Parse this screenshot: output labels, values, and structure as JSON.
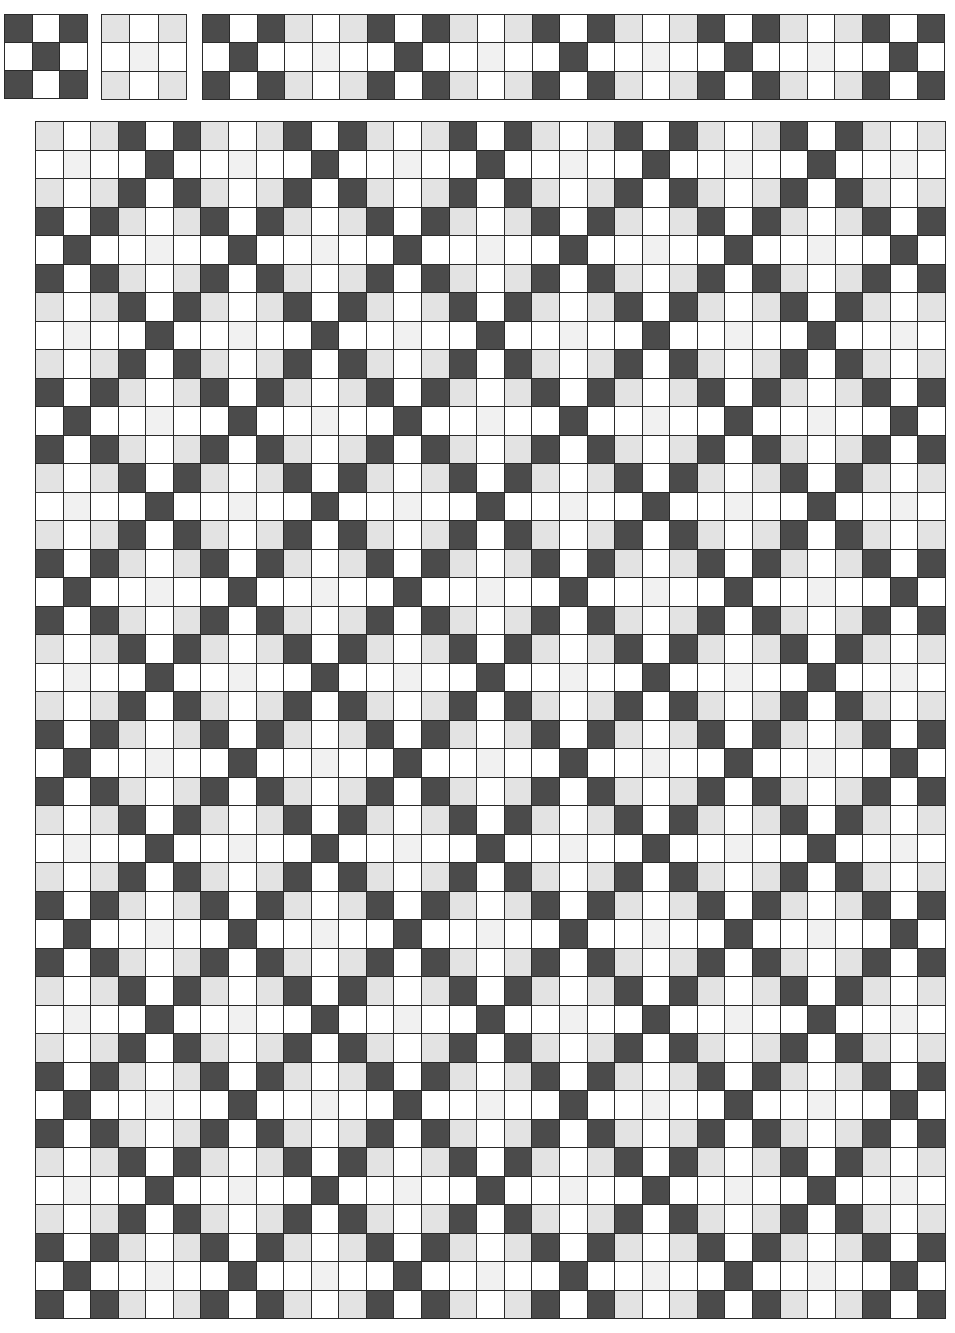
{
  "legend": {
    "D": "dark (interlaced)",
    "L": "light gray",
    "V": "very light gray",
    "W": "white"
  },
  "colors": {
    "D": "#4b4b4b",
    "L": "#e3e3e3",
    "V": "#f1f1f1",
    "W": "#ffffff",
    "grid_line": "#2a2a2a"
  },
  "threading_block": {
    "cols": 3,
    "rows": 3,
    "cells": [
      "DWD",
      "WDW",
      "DWD"
    ]
  },
  "tieup_block": {
    "cols": 3,
    "rows": 3,
    "cells": [
      "LWL",
      "WVW",
      "LWL"
    ]
  },
  "treadling_strip": {
    "cols": 27,
    "rows": 3,
    "cells": [
      "DWDLWLDWDLWLDWDLWLDWDLWLDWD",
      "WDWWVWWDWWVWWDWWVWWDWWVWWDW",
      "DWDLWLDWDLWLDWDLWLDWDLWLDWD"
    ]
  },
  "drawdown": {
    "cols": 33,
    "rows": 42,
    "repeat": "6x6",
    "cells": [
      "LWLDWDLWLDWDLWLDWDLWLDWDLWLDWDLWL",
      "WVWWDWWVWWDWWVWWDWWVWWDWWVWWDWWVW",
      "LWLDWDLWLDWDLWLDWDLWLDWDLWLDWDLWL",
      "DWDLWLDWDLWLDWDLWLDWDLWLDWDLWLDWD",
      "WDWWVWWDWWVWWDWWVWWDWWVWWDWWVWWDW",
      "DWDLWLDWDLWLDWDLWLDWDLWLDWDLWLDWD",
      "LWLDWDLWLDWDLWLDWDLWLDWDLWLDWDLWL",
      "WVWWDWWVWWDWWVWWDWWVWWDWWVWWDWWVW",
      "LWLDWDLWLDWDLWLDWDLWLDWDLWLDWDLWL",
      "DWDLWLDWDLWLDWDLWLDWDLWLDWDLWLDWD",
      "WDWWVWWDWWVWWDWWVWWDWWVWWDWWVWWDW",
      "DWDLWLDWDLWLDWDLWLDWDLWLDWDLWLDWD",
      "LWLDWDLWLDWDLWLDWDLWLDWDLWLDWDLWL",
      "WVWWDWWVWWDWWVWWDWWVWWDWWVWWDWWVW",
      "LWLDWDLWLDWDLWLDWDLWLDWDLWLDWDLWL",
      "DWDLWLDWDLWLDWDLWLDWDLWLDWDLWLDWD",
      "WDWWVWWDWWVWWDWWVWWDWWVWWDWWVWWDW",
      "DWDLWLDWDLWLDWDLWLDWDLWLDWDLWLDWD",
      "LWLDWDLWLDWDLWLDWDLWLDWDLWLDWDLWL",
      "WVWWDWWVWWDWWVWWDWWVWWDWWVWWDWWVW",
      "LWLDWDLWLDWDLWLDWDLWLDWDLWLDWDLWL",
      "DWDLWLDWDLWLDWDLWLDWDLWLDWDLWLDWD",
      "WDWWVWWDWWVWWDWWVWWDWWVWWDWWVWWDW",
      "DWDLWLDWDLWLDWDLWLDWDLWLDWDLWLDWD",
      "LWLDWDLWLDWDLWLDWDLWLDWDLWLDWDLWL",
      "WVWWDWWVWWDWWVWWDWWVWWDWWVWWDWWVW",
      "LWLDWDLWLDWDLWLDWDLWLDWDLWLDWDLWL",
      "DWDLWLDWDLWLDWDLWLDWDLWLDWDLWLDWD",
      "WDWWVWWDWWVWWDWWVWWDWWVWWDWWVWWDW",
      "DWDLWLDWDLWLDWDLWLDWDLWLDWDLWLDWD",
      "LWLDWDLWLDWDLWLDWDLWLDWDLWLDWDLWL",
      "WVWWDWWVWWDWWVWWDWWVWWDWWVWWDWWVW",
      "LWLDWDLWLDWDLWLDWDLWLDWDLWLDWDLWL",
      "DWDLWLDWDLWLDWDLWLDWDLWLDWDLWLDWD",
      "WDWWVWWDWWVWWDWWVWWDWWVWWDWWVWWDW",
      "DWDLWLDWDLWLDWDLWLDWDLWLDWDLWLDWD",
      "LWLDWDLWLDWDLWLDWDLWLDWDLWLDWDLWL",
      "WVWWDWWVWWDWWVWWDWWVWWDWWVWWDWWVW",
      "LWLDWDLWLDWDLWLDWDLWLDWDLWLDWDLWL",
      "DWDLWLDWDLWLDWDLWLDWDLWLDWDLWLDWD",
      "WDWWVWWDWWVWWDWWVWWDWWVWWDWWVWWDW",
      "DWDLWLDWDLWLDWDLWLDWDLWLDWDLWLDWD"
    ]
  }
}
